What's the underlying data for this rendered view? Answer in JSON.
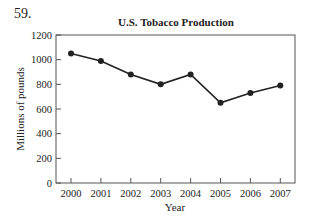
{
  "problem": {
    "number": "59."
  },
  "chart_data": {
    "type": "line",
    "title": "U.S. Tobacco Production",
    "xlabel": "Year",
    "ylabel": "Millions of pounds",
    "categories": [
      "2000",
      "2001",
      "2002",
      "2003",
      "2004",
      "2005",
      "2006",
      "2007"
    ],
    "series": [
      {
        "name": "U.S. Tobacco Production",
        "values": [
          1050,
          990,
          880,
          800,
          880,
          650,
          730,
          790
        ]
      }
    ],
    "yticks": [
      0,
      200,
      400,
      600,
      800,
      1000,
      1200
    ],
    "ylim": [
      0,
      1200
    ],
    "grid": false,
    "legend": "none",
    "marker": "filled-circle",
    "line_color": "#222222"
  }
}
